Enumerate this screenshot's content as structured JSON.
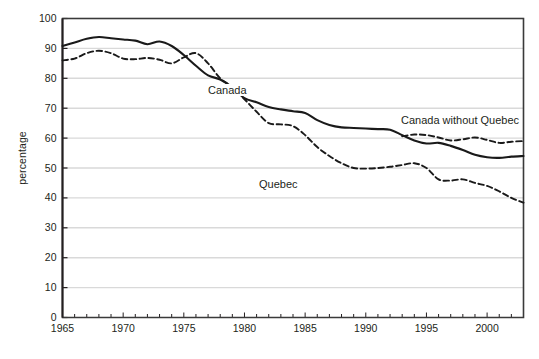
{
  "chart_data": {
    "type": "line",
    "title": "",
    "xlabel": "",
    "ylabel": "percentage",
    "xlim": [
      1965,
      2003
    ],
    "ylim": [
      0,
      100
    ],
    "grid": true,
    "legend_position": "inline-annotations",
    "y_ticks": [
      0,
      10,
      20,
      30,
      40,
      50,
      60,
      70,
      80,
      90,
      100
    ],
    "x_ticks": [
      1965,
      1970,
      1975,
      1980,
      1985,
      1990,
      1995,
      2000
    ],
    "x_tick_labels": [
      "1965",
      "1970",
      "1975",
      "1980",
      "1985",
      "1990",
      "1995",
      "2000"
    ],
    "y_tick_labels": [
      "0",
      "10",
      "20",
      "30",
      "40",
      "50",
      "60",
      "70",
      "80",
      "90",
      "100"
    ],
    "x_minor_tick_interval": 1,
    "series": [
      {
        "name": "Canada",
        "style": "solid",
        "color": "#1a1a1a",
        "x": [
          1965,
          1966,
          1967,
          1968,
          1969,
          1970,
          1971,
          1972,
          1973,
          1974,
          1975,
          1976,
          1977,
          1978,
          1979,
          1980,
          1981,
          1982,
          1983,
          1984,
          1985,
          1986,
          1987,
          1988,
          1989,
          1990,
          1991,
          1992,
          1993,
          1994,
          1995,
          1996,
          1997,
          1998,
          1999,
          2000,
          2001,
          2002,
          2003
        ],
        "values": [
          90.8,
          92.0,
          93.2,
          93.8,
          93.4,
          93.0,
          92.6,
          91.4,
          92.3,
          90.8,
          87.8,
          84.2,
          81.0,
          79.6,
          77.0,
          73.4,
          72.0,
          70.4,
          69.6,
          69.0,
          68.4,
          66.0,
          64.4,
          63.6,
          63.4,
          63.2,
          63.0,
          62.8,
          61.0,
          59.2,
          58.2,
          58.4,
          57.4,
          56.0,
          54.4,
          53.6,
          53.4,
          53.8,
          54.0
        ]
      },
      {
        "name": "Quebec",
        "style": "dashed",
        "color": "#1a1a1a",
        "x": [
          1965,
          1966,
          1967,
          1968,
          1969,
          1970,
          1971,
          1972,
          1973,
          1974,
          1975,
          1976,
          1977,
          1978,
          1979,
          1980,
          1981,
          1982,
          1983,
          1984,
          1985,
          1986,
          1987,
          1988,
          1989,
          1990,
          1991,
          1992,
          1993,
          1994,
          1995,
          1996,
          1997,
          1998,
          1999,
          2000,
          2001,
          2002,
          2003
        ],
        "values": [
          86.0,
          86.6,
          88.4,
          89.2,
          88.4,
          86.6,
          86.4,
          86.8,
          86.2,
          85.0,
          87.0,
          88.4,
          85.0,
          80.0,
          77.0,
          73.0,
          68.8,
          65.0,
          64.6,
          64.0,
          61.0,
          57.0,
          54.0,
          51.6,
          50.0,
          49.8,
          50.0,
          50.4,
          51.0,
          51.6,
          50.0,
          46.2,
          45.8,
          46.2,
          45.0,
          44.0,
          42.2,
          40.0,
          38.4
        ]
      },
      {
        "name": "Canada without Quebec",
        "style": "dashed",
        "color": "#1a1a1a",
        "x": [
          1993,
          1994,
          1995,
          1996,
          1997,
          1998,
          1999,
          2000,
          2001,
          2002,
          2003
        ],
        "values": [
          60.6,
          61.2,
          61.0,
          60.2,
          59.2,
          59.6,
          60.2,
          59.4,
          58.4,
          58.8,
          59.0
        ]
      }
    ],
    "annotations": [
      {
        "text": "Canada",
        "x": 1977.5,
        "y": 77.5
      },
      {
        "text": "Quebec",
        "x": 1981.5,
        "y": 46.5
      },
      {
        "text": "Canada without Quebec",
        "x": 1993.5,
        "y": 66.5
      }
    ]
  },
  "axes": {
    "y_title": "percentage"
  },
  "caption": {
    "text": ""
  }
}
